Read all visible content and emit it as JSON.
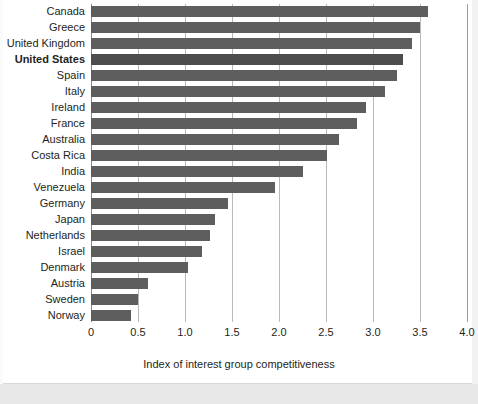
{
  "chart_data": {
    "type": "bar",
    "orientation": "horizontal",
    "title": "",
    "xlabel": "Index of interest group competitiveness",
    "ylabel": "",
    "xlim": [
      0,
      4.0
    ],
    "xticks": [
      "0",
      "0.5",
      "1.0",
      "1.5",
      "2.0",
      "2.5",
      "3.0",
      "3.5",
      "4.0"
    ],
    "xtick_values": [
      0,
      0.5,
      1.0,
      1.5,
      2.0,
      2.5,
      3.0,
      3.5,
      4.0
    ],
    "grid": true,
    "legend": "none",
    "bar_color": "#5e5e5e",
    "highlight_color": "#4d4d4d",
    "highlight_category": "United States",
    "categories": [
      "Canada",
      "Greece",
      "United Kingdom",
      "United States",
      "Spain",
      "Italy",
      "Ireland",
      "France",
      "Australia",
      "Costa Rica",
      "India",
      "Venezuela",
      "Germany",
      "Japan",
      "Netherlands",
      "Israel",
      "Denmark",
      "Austria",
      "Sweden",
      "Norway"
    ],
    "values": [
      3.58,
      3.5,
      3.42,
      3.32,
      3.25,
      3.13,
      2.93,
      2.83,
      2.64,
      2.51,
      2.26,
      1.96,
      1.46,
      1.32,
      1.27,
      1.18,
      1.03,
      0.61,
      0.5,
      0.43
    ]
  }
}
